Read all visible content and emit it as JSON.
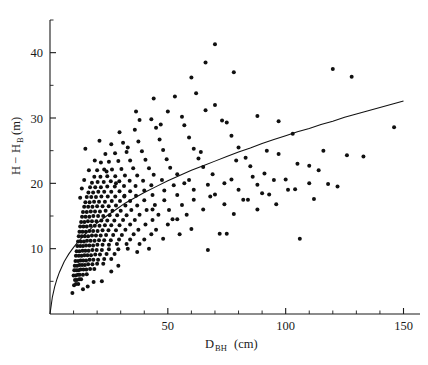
{
  "chart_data": {
    "type": "scatter",
    "title": "",
    "xlabel": "D_BH (cm)",
    "xlabel_main": "D",
    "xlabel_sub": "BH",
    "xlabel_unit": "(cm)",
    "ylabel": "H - H_B (m)",
    "ylabel_main_a": "H",
    "ylabel_minus": "−",
    "ylabel_main_b": "H",
    "ylabel_sub": "B",
    "ylabel_unit": "(m)",
    "xlim": [
      0,
      157
    ],
    "ylim": [
      0,
      45
    ],
    "grid": false,
    "legend": null,
    "xticks_major": [
      50,
      100,
      150
    ],
    "xticks_major_labels": [
      "50",
      "100",
      "150"
    ],
    "xticks_minor": [
      10,
      20,
      30,
      40,
      60,
      70,
      80,
      90,
      110,
      120,
      130,
      140
    ],
    "yticks_major": [
      10,
      20,
      30,
      40
    ],
    "yticks_major_labels": [
      "10",
      "20",
      "30",
      "40"
    ],
    "yticks_minor": [
      5,
      15,
      25,
      35,
      45
    ],
    "marker": {
      "shape": "circle",
      "size_px": 2.0,
      "color": "#101010"
    },
    "fit_curve": {
      "name": "fitted height-diameter curve",
      "type": "power",
      "color": "#111111",
      "points": [
        [
          0.0,
          0.0
        ],
        [
          1.0,
          2.6
        ],
        [
          2.0,
          4.2
        ],
        [
          3.0,
          5.4
        ],
        [
          4.0,
          6.4
        ],
        [
          5.0,
          7.2
        ],
        [
          6.0,
          8.0
        ],
        [
          7.0,
          8.6
        ],
        [
          8.0,
          9.2
        ],
        [
          9.0,
          9.7
        ],
        [
          10.0,
          10.2
        ],
        [
          12.0,
          11.1
        ],
        [
          14.0,
          11.9
        ],
        [
          16.0,
          12.6
        ],
        [
          18.0,
          13.3
        ],
        [
          20.0,
          13.9
        ],
        [
          24.0,
          15.0
        ],
        [
          28.0,
          16.0
        ],
        [
          32.0,
          17.0
        ],
        [
          36.0,
          17.8
        ],
        [
          40.0,
          18.6
        ],
        [
          45.0,
          19.5
        ],
        [
          50.0,
          20.4
        ],
        [
          55.0,
          21.2
        ],
        [
          60.0,
          22.0
        ],
        [
          65.0,
          22.7
        ],
        [
          70.0,
          23.4
        ],
        [
          75.0,
          24.1
        ],
        [
          80.0,
          24.8
        ],
        [
          85.0,
          25.4
        ],
        [
          90.0,
          26.1
        ],
        [
          95.0,
          26.7
        ],
        [
          100.0,
          27.3
        ],
        [
          105.0,
          27.9
        ],
        [
          110.0,
          28.4
        ],
        [
          115.0,
          29.0
        ],
        [
          120.0,
          29.5
        ],
        [
          125.0,
          30.1
        ],
        [
          130.0,
          30.6
        ],
        [
          135.0,
          31.1
        ],
        [
          140.0,
          31.6
        ],
        [
          145.0,
          32.1
        ],
        [
          150.0,
          32.6
        ]
      ]
    },
    "points": [
      [
        9.5,
        3.2
      ],
      [
        10.2,
        4.4
      ],
      [
        11.0,
        4.6
      ],
      [
        12.0,
        4.6
      ],
      [
        10.6,
        5.2
      ],
      [
        11.4,
        5.2
      ],
      [
        12.4,
        5.3
      ],
      [
        13.2,
        5.3
      ],
      [
        10.0,
        5.9
      ],
      [
        10.9,
        5.9
      ],
      [
        11.8,
        6.0
      ],
      [
        12.6,
        6.0
      ],
      [
        14.0,
        6.0
      ],
      [
        15.6,
        6.1
      ],
      [
        10.3,
        6.7
      ],
      [
        11.2,
        6.7
      ],
      [
        12.1,
        6.7
      ],
      [
        13.0,
        6.8
      ],
      [
        14.2,
        6.8
      ],
      [
        15.4,
        6.8
      ],
      [
        17.0,
        6.9
      ],
      [
        18.8,
        6.9
      ],
      [
        10.5,
        7.4
      ],
      [
        11.5,
        7.4
      ],
      [
        12.5,
        7.5
      ],
      [
        13.6,
        7.5
      ],
      [
        14.8,
        7.5
      ],
      [
        16.2,
        7.6
      ],
      [
        18.0,
        7.6
      ],
      [
        20.0,
        7.7
      ],
      [
        22.6,
        7.7
      ],
      [
        10.8,
        8.1
      ],
      [
        11.9,
        8.1
      ],
      [
        13.0,
        8.2
      ],
      [
        14.1,
        8.2
      ],
      [
        15.3,
        8.2
      ],
      [
        16.8,
        8.3
      ],
      [
        18.4,
        8.3
      ],
      [
        20.4,
        8.3
      ],
      [
        23.0,
        8.4
      ],
      [
        26.0,
        8.4
      ],
      [
        11.0,
        8.9
      ],
      [
        12.2,
        8.9
      ],
      [
        13.4,
        8.9
      ],
      [
        14.6,
        9.0
      ],
      [
        15.9,
        9.0
      ],
      [
        17.4,
        9.0
      ],
      [
        19.2,
        9.1
      ],
      [
        21.2,
        9.1
      ],
      [
        24.0,
        9.2
      ],
      [
        27.4,
        9.2
      ],
      [
        11.3,
        9.6
      ],
      [
        12.5,
        9.6
      ],
      [
        13.8,
        9.7
      ],
      [
        15.0,
        9.7
      ],
      [
        16.4,
        9.7
      ],
      [
        18.0,
        9.8
      ],
      [
        19.8,
        9.8
      ],
      [
        22.0,
        9.8
      ],
      [
        25.0,
        9.9
      ],
      [
        29.0,
        9.9
      ],
      [
        33.0,
        10.0
      ],
      [
        42.0,
        10.0
      ],
      [
        11.6,
        10.4
      ],
      [
        12.8,
        10.4
      ],
      [
        14.0,
        10.4
      ],
      [
        15.3,
        10.5
      ],
      [
        16.7,
        10.5
      ],
      [
        18.3,
        10.5
      ],
      [
        20.1,
        10.6
      ],
      [
        22.3,
        10.6
      ],
      [
        25.0,
        10.6
      ],
      [
        28.4,
        10.7
      ],
      [
        32.5,
        10.7
      ],
      [
        38.0,
        10.7
      ],
      [
        11.9,
        11.1
      ],
      [
        13.1,
        11.1
      ],
      [
        14.4,
        11.1
      ],
      [
        15.7,
        11.2
      ],
      [
        17.2,
        11.2
      ],
      [
        18.9,
        11.2
      ],
      [
        20.8,
        11.3
      ],
      [
        23.0,
        11.3
      ],
      [
        25.8,
        11.3
      ],
      [
        29.3,
        11.4
      ],
      [
        34.0,
        11.4
      ],
      [
        40.0,
        11.4
      ],
      [
        48.0,
        11.5
      ],
      [
        106.0,
        11.5
      ],
      [
        12.2,
        11.9
      ],
      [
        13.5,
        11.9
      ],
      [
        14.8,
        11.9
      ],
      [
        16.2,
        11.9
      ],
      [
        17.8,
        12.0
      ],
      [
        19.5,
        12.0
      ],
      [
        21.5,
        12.0
      ],
      [
        23.8,
        12.1
      ],
      [
        26.8,
        12.1
      ],
      [
        30.5,
        12.1
      ],
      [
        35.5,
        12.2
      ],
      [
        43.0,
        12.2
      ],
      [
        55.0,
        12.2
      ],
      [
        72.0,
        12.3
      ],
      [
        12.5,
        12.6
      ],
      [
        13.8,
        12.6
      ],
      [
        15.2,
        12.6
      ],
      [
        16.7,
        12.7
      ],
      [
        18.3,
        12.7
      ],
      [
        20.2,
        12.7
      ],
      [
        22.3,
        12.8
      ],
      [
        24.8,
        12.8
      ],
      [
        28.0,
        12.8
      ],
      [
        32.0,
        12.9
      ],
      [
        37.5,
        12.9
      ],
      [
        45.0,
        12.9
      ],
      [
        12.8,
        13.4
      ],
      [
        14.2,
        13.4
      ],
      [
        15.6,
        13.4
      ],
      [
        17.2,
        13.5
      ],
      [
        19.0,
        13.5
      ],
      [
        21.0,
        13.5
      ],
      [
        23.3,
        13.6
      ],
      [
        26.0,
        13.6
      ],
      [
        29.5,
        13.6
      ],
      [
        34.0,
        13.7
      ],
      [
        40.5,
        13.7
      ],
      [
        50.0,
        13.7
      ],
      [
        13.2,
        14.1
      ],
      [
        14.6,
        14.1
      ],
      [
        16.1,
        14.2
      ],
      [
        17.8,
        14.2
      ],
      [
        19.7,
        14.2
      ],
      [
        21.8,
        14.3
      ],
      [
        24.3,
        14.3
      ],
      [
        27.3,
        14.3
      ],
      [
        31.0,
        14.4
      ],
      [
        36.0,
        14.4
      ],
      [
        43.5,
        14.4
      ],
      [
        54.0,
        14.5
      ],
      [
        13.6,
        14.9
      ],
      [
        15.1,
        14.9
      ],
      [
        16.7,
        14.9
      ],
      [
        18.4,
        15.0
      ],
      [
        20.4,
        15.0
      ],
      [
        22.6,
        15.0
      ],
      [
        25.3,
        15.1
      ],
      [
        28.5,
        15.1
      ],
      [
        32.5,
        15.1
      ],
      [
        38.0,
        15.2
      ],
      [
        46.0,
        15.2
      ],
      [
        58.0,
        15.2
      ],
      [
        78.0,
        15.3
      ],
      [
        14.0,
        15.6
      ],
      [
        15.6,
        15.6
      ],
      [
        17.3,
        15.7
      ],
      [
        19.1,
        15.7
      ],
      [
        21.2,
        15.7
      ],
      [
        23.6,
        15.8
      ],
      [
        26.5,
        15.8
      ],
      [
        30.0,
        15.8
      ],
      [
        34.5,
        15.9
      ],
      [
        41.0,
        15.9
      ],
      [
        50.5,
        15.9
      ],
      [
        65.0,
        16.0
      ],
      [
        88.0,
        16.0
      ],
      [
        14.5,
        16.4
      ],
      [
        16.2,
        16.4
      ],
      [
        18.0,
        16.4
      ],
      [
        20.0,
        16.5
      ],
      [
        22.3,
        16.5
      ],
      [
        24.9,
        16.5
      ],
      [
        28.0,
        16.6
      ],
      [
        32.0,
        16.6
      ],
      [
        37.0,
        16.6
      ],
      [
        44.5,
        16.7
      ],
      [
        56.0,
        16.7
      ],
      [
        74.0,
        16.8
      ],
      [
        96.0,
        16.8
      ],
      [
        15.0,
        17.1
      ],
      [
        16.8,
        17.1
      ],
      [
        18.7,
        17.2
      ],
      [
        20.8,
        17.2
      ],
      [
        23.3,
        17.2
      ],
      [
        26.2,
        17.3
      ],
      [
        29.7,
        17.3
      ],
      [
        34.0,
        17.3
      ],
      [
        40.0,
        17.4
      ],
      [
        48.5,
        17.4
      ],
      [
        61.0,
        17.5
      ],
      [
        82.0,
        17.5
      ],
      [
        112.0,
        17.6
      ],
      [
        15.6,
        17.9
      ],
      [
        17.5,
        17.9
      ],
      [
        19.5,
        17.9
      ],
      [
        21.8,
        18.0
      ],
      [
        24.5,
        18.0
      ],
      [
        27.7,
        18.0
      ],
      [
        31.6,
        18.1
      ],
      [
        36.5,
        18.1
      ],
      [
        43.5,
        18.2
      ],
      [
        54.0,
        18.2
      ],
      [
        70.0,
        18.3
      ],
      [
        93.0,
        18.3
      ],
      [
        16.3,
        18.6
      ],
      [
        18.3,
        18.6
      ],
      [
        20.5,
        18.7
      ],
      [
        23.0,
        18.7
      ],
      [
        26.0,
        18.7
      ],
      [
        29.5,
        18.8
      ],
      [
        34.0,
        18.8
      ],
      [
        40.0,
        18.9
      ],
      [
        48.5,
        18.9
      ],
      [
        61.0,
        19.0
      ],
      [
        80.0,
        19.0
      ],
      [
        104.0,
        19.1
      ],
      [
        17.0,
        19.4
      ],
      [
        19.2,
        19.4
      ],
      [
        21.6,
        19.4
      ],
      [
        24.3,
        19.5
      ],
      [
        27.5,
        19.5
      ],
      [
        31.4,
        19.6
      ],
      [
        36.3,
        19.6
      ],
      [
        43.0,
        19.7
      ],
      [
        52.5,
        19.7
      ],
      [
        67.0,
        19.8
      ],
      [
        88.0,
        19.8
      ],
      [
        118.0,
        19.9
      ],
      [
        17.8,
        20.1
      ],
      [
        20.2,
        20.2
      ],
      [
        22.8,
        20.2
      ],
      [
        25.8,
        20.3
      ],
      [
        29.4,
        20.3
      ],
      [
        33.8,
        20.4
      ],
      [
        39.5,
        20.4
      ],
      [
        47.5,
        20.5
      ],
      [
        59.0,
        20.5
      ],
      [
        77.0,
        20.6
      ],
      [
        100.0,
        20.6
      ],
      [
        18.8,
        21.0
      ],
      [
        21.4,
        21.0
      ],
      [
        24.3,
        21.1
      ],
      [
        27.7,
        21.1
      ],
      [
        31.8,
        21.2
      ],
      [
        37.0,
        21.2
      ],
      [
        44.0,
        21.3
      ],
      [
        54.0,
        21.4
      ],
      [
        69.0,
        21.4
      ],
      [
        91.0,
        21.5
      ],
      [
        20.0,
        22.0
      ],
      [
        23.0,
        22.1
      ],
      [
        26.3,
        22.1
      ],
      [
        30.3,
        22.2
      ],
      [
        35.3,
        22.3
      ],
      [
        42.0,
        22.3
      ],
      [
        51.0,
        22.4
      ],
      [
        65.0,
        22.5
      ],
      [
        85.0,
        22.6
      ],
      [
        110.0,
        22.7
      ],
      [
        21.6,
        23.2
      ],
      [
        25.0,
        23.3
      ],
      [
        29.0,
        23.4
      ],
      [
        34.0,
        23.5
      ],
      [
        40.5,
        23.6
      ],
      [
        49.5,
        23.7
      ],
      [
        63.0,
        23.8
      ],
      [
        83.0,
        23.9
      ],
      [
        126.0,
        24.3
      ],
      [
        23.5,
        24.5
      ],
      [
        27.6,
        24.6
      ],
      [
        32.5,
        24.8
      ],
      [
        39.0,
        24.9
      ],
      [
        48.0,
        25.1
      ],
      [
        61.0,
        25.3
      ],
      [
        80.0,
        25.5
      ],
      [
        26.0,
        26.0
      ],
      [
        31.0,
        26.2
      ],
      [
        37.5,
        26.4
      ],
      [
        46.5,
        26.7
      ],
      [
        59.0,
        27.0
      ],
      [
        77.0,
        27.3
      ],
      [
        103.0,
        27.6
      ],
      [
        29.5,
        27.8
      ],
      [
        36.0,
        28.2
      ],
      [
        45.0,
        28.5
      ],
      [
        57.0,
        28.9
      ],
      [
        75.0,
        29.3
      ],
      [
        43.0,
        29.8
      ],
      [
        56.0,
        30.2
      ],
      [
        73.0,
        29.6
      ],
      [
        97.0,
        29.5
      ],
      [
        38.0,
        29.7
      ],
      [
        50.0,
        31.0
      ],
      [
        66.0,
        31.2
      ],
      [
        88.0,
        30.3
      ],
      [
        53.0,
        33.3
      ],
      [
        62.0,
        33.8
      ],
      [
        70.0,
        32.0
      ],
      [
        60.0,
        36.2
      ],
      [
        66.0,
        38.5
      ],
      [
        70.0,
        41.3
      ],
      [
        78.0,
        37.0
      ],
      [
        120.0,
        37.5
      ],
      [
        128.0,
        36.3
      ],
      [
        146.0,
        28.6
      ],
      [
        97.0,
        24.5
      ],
      [
        105.0,
        23.0
      ],
      [
        114.0,
        22.0
      ],
      [
        133.0,
        24.1
      ],
      [
        86.0,
        21.0
      ],
      [
        92.0,
        25.0
      ],
      [
        110.0,
        20.0
      ],
      [
        122.0,
        19.5
      ],
      [
        44.0,
        33.0
      ],
      [
        36.5,
        31.0
      ],
      [
        47.0,
        29.0
      ],
      [
        33.0,
        25.5
      ],
      [
        24.0,
        21.8
      ],
      [
        19.0,
        23.5
      ],
      [
        16.5,
        22.0
      ],
      [
        14.5,
        20.5
      ],
      [
        13.5,
        19.2
      ],
      [
        12.8,
        17.8
      ],
      [
        15.0,
        25.3
      ],
      [
        21.0,
        26.5
      ],
      [
        28.0,
        20.0
      ],
      [
        31.5,
        18.0
      ],
      [
        57.0,
        20.0
      ],
      [
        64.0,
        24.8
      ],
      [
        68.0,
        18.0
      ],
      [
        74.0,
        20.0
      ],
      [
        79.0,
        23.5
      ],
      [
        84.0,
        17.5
      ],
      [
        90.0,
        18.5
      ],
      [
        95.0,
        20.5
      ],
      [
        101.0,
        19.0
      ],
      [
        116.0,
        25.0
      ],
      [
        43.5,
        16.0
      ],
      [
        52.0,
        14.5
      ],
      [
        60.0,
        13.0
      ],
      [
        67.0,
        9.8
      ],
      [
        75.0,
        12.3
      ],
      [
        37.0,
        9.5
      ],
      [
        29.0,
        7.4
      ],
      [
        26.0,
        6.5
      ],
      [
        22.0,
        5.0
      ],
      [
        18.5,
        4.9
      ],
      [
        16.0,
        4.2
      ],
      [
        14.0,
        3.8
      ]
    ]
  }
}
